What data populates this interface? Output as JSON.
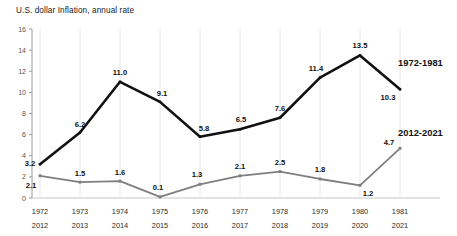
{
  "chart_data": {
    "type": "line",
    "title": "U.S. dollar Inflation, annual rate",
    "xlabel": "",
    "ylabel": "",
    "ylim": [
      0,
      16
    ],
    "yticks": [
      0,
      2,
      4,
      6,
      8,
      10,
      12,
      14,
      16
    ],
    "grid": "vertical-only",
    "legend_position": "inline-right",
    "categories": [
      "1972",
      "1973",
      "1974",
      "1975",
      "1976",
      "1977",
      "1978",
      "1979",
      "1980",
      "1981"
    ],
    "categories_secondary": [
      "2012",
      "2013",
      "2014",
      "2015",
      "2016",
      "2017",
      "2018",
      "2019",
      "2020",
      "2021"
    ],
    "series": [
      {
        "name": "1972-1981",
        "color": "#111111",
        "values": [
          3.2,
          6.2,
          11.0,
          9.1,
          5.8,
          6.5,
          7.6,
          11.4,
          13.5,
          10.3
        ],
        "labels": [
          "3.2",
          "6.2",
          "11.0",
          "9.1",
          "5.8",
          "6.5",
          "7.6",
          "11.4",
          "13.5",
          "10.3"
        ]
      },
      {
        "name": "2012-2021",
        "color": "#7f7f7f",
        "values": [
          2.1,
          1.5,
          1.6,
          0.1,
          1.3,
          2.1,
          2.5,
          1.8,
          1.2,
          4.7
        ],
        "labels": [
          "2.1",
          "1.5",
          "1.6",
          "0.1",
          "1.3",
          "2.1",
          "2.5",
          "1.8",
          "1.2",
          "4.7"
        ]
      }
    ],
    "annotations": [
      {
        "text": "1972-1981",
        "series": "1972-1981"
      },
      {
        "text": "2012-2021",
        "series": "2012-2021"
      }
    ]
  }
}
